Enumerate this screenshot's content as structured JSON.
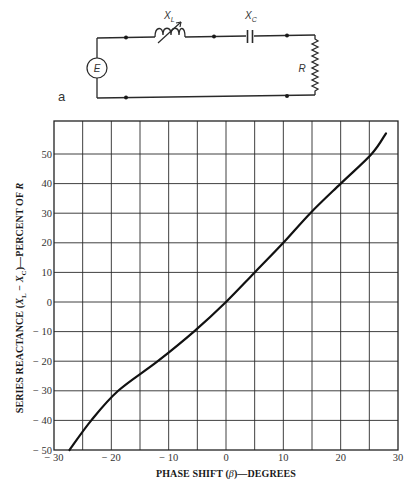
{
  "circuit": {
    "panel_label": "a",
    "source_label": "E",
    "inductor_label": "X",
    "inductor_sub": "L",
    "capacitor_label": "X",
    "capacitor_sub": "C",
    "resistor_label": "R"
  },
  "chart_data": {
    "type": "line",
    "title": "",
    "xlabel": "PHASE SHIFT (β)—DEGREES",
    "ylabel": "SERIES REACTANCE (X_L − X_C)—PERCENT OF R",
    "xlim": [
      -30,
      30
    ],
    "ylim": [
      -50,
      61
    ],
    "x_ticks": [
      -30,
      -20,
      -10,
      0,
      10,
      20,
      30
    ],
    "x_tick_labels": [
      "− 30",
      "− 20",
      "− 10",
      "0",
      "10",
      "20",
      "30"
    ],
    "y_ticks": [
      -50,
      -40,
      -30,
      -20,
      -10,
      0,
      10,
      20,
      30,
      40,
      50
    ],
    "y_tick_labels": [
      "− 50",
      "− 40",
      "− 30",
      "− 20",
      "− 10",
      "0",
      "10",
      "20",
      "30",
      "40",
      "50"
    ],
    "grid": true,
    "x_grid_step": 5,
    "y_grid_step": 10,
    "legend": null,
    "series": [
      {
        "name": "Series reactance vs phase shift",
        "x": [
          -27.3,
          -23.5,
          -18.8,
          -11.9,
          -5.6,
          0,
          5,
          10,
          14.7,
          20,
          25.4,
          27.9
        ],
        "y": [
          -50,
          -40,
          -30,
          -20,
          -10,
          0,
          10,
          20,
          30,
          40,
          50,
          57
        ]
      }
    ]
  },
  "axes": {
    "x_title_main": "PHASE SHIFT (",
    "x_title_sym": "β",
    "x_title_end": ")—DEGREES",
    "y_title_main": "SERIES REACTANCE (",
    "y_title_x1": "X",
    "y_title_s1": "L",
    "y_title_mid": " − ",
    "y_title_x2": "X",
    "y_title_s2": "C",
    "y_title_end": ")—PERCENT OF ",
    "y_title_r": "R"
  }
}
